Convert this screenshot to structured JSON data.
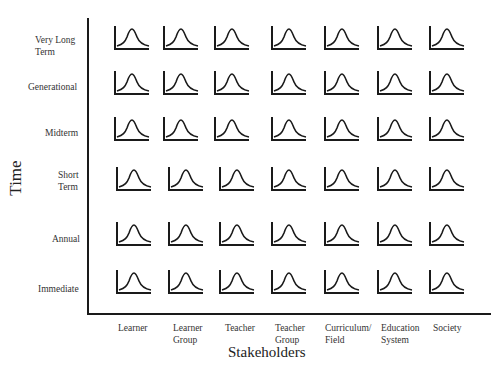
{
  "diagram": {
    "y_axis_title": "Time",
    "x_axis_title": "Stakeholders",
    "rows": [
      {
        "label": "Very Long Term",
        "line1": "Very Long",
        "line2": "Term"
      },
      {
        "label": "Generational",
        "line1": "Generational",
        "line2": ""
      },
      {
        "label": "Midterm",
        "line1": "Midterm",
        "line2": ""
      },
      {
        "label": "Short Term",
        "line1": "Short",
        "line2": "Term"
      },
      {
        "label": "Annual",
        "line1": "Annual",
        "line2": ""
      },
      {
        "label": "Immediate",
        "line1": "Immediate",
        "line2": ""
      }
    ],
    "columns": [
      {
        "label": "Learner",
        "line1": "Learner",
        "line2": ""
      },
      {
        "label": "Learner Group",
        "line1": "Learner",
        "line2": "Group"
      },
      {
        "label": "Teacher",
        "line1": "Teacher",
        "line2": ""
      },
      {
        "label": "Teacher Group",
        "line1": "Teacher",
        "line2": "Group"
      },
      {
        "label": "Curriculum/ Field",
        "line1": "Curriculum/",
        "line2": "Field"
      },
      {
        "label": "Education System",
        "line1": "Education",
        "line2": "System"
      },
      {
        "label": "Society",
        "line1": "Society",
        "line2": ""
      }
    ],
    "cell_icon": "bell-curve-icon",
    "colors": {
      "ink": "#1a1a1a",
      "background": "#ffffff"
    }
  }
}
